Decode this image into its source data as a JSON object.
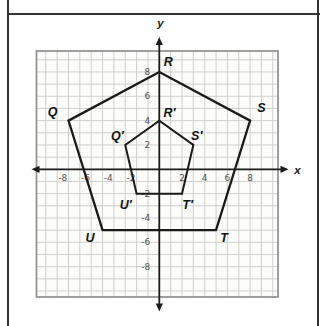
{
  "frame": {
    "line_color": "#333333"
  },
  "chart_data": {
    "type": "coordinate-plane-polygons",
    "axes": {
      "x_label": "x",
      "y_label": "y",
      "x_range": [
        -10,
        10
      ],
      "y_range": [
        -10,
        10
      ],
      "grid": true
    },
    "x_ticks": [
      {
        "v": -8,
        "label": "-8"
      },
      {
        "v": -6,
        "label": "-6"
      },
      {
        "v": -4,
        "label": "-4"
      },
      {
        "v": -2,
        "label": "-2"
      },
      {
        "v": 2,
        "label": "2"
      },
      {
        "v": 4,
        "label": "4"
      },
      {
        "v": 6,
        "label": "6"
      },
      {
        "v": 8,
        "label": "8"
      }
    ],
    "y_ticks": [
      {
        "v": 8,
        "label": "8"
      },
      {
        "v": 6,
        "label": "6"
      },
      {
        "v": 4,
        "label": "4"
      },
      {
        "v": 2,
        "label": "2"
      },
      {
        "v": -2,
        "label": "-2"
      },
      {
        "v": -4,
        "label": "-4"
      },
      {
        "v": -6,
        "label": "-6"
      },
      {
        "v": -8,
        "label": "-8"
      }
    ],
    "polygons": [
      {
        "id": "pentagon-QRSTU",
        "stroke_width": 2.3,
        "vertices": [
          {
            "label": "Q",
            "x": -8,
            "y": 4,
            "lx": -9.4,
            "ly": 4.7
          },
          {
            "label": "R",
            "x": 0,
            "y": 8,
            "lx": 0.8,
            "ly": 8.85
          },
          {
            "label": "S",
            "x": 8,
            "y": 4,
            "lx": 9.0,
            "ly": 5.0
          },
          {
            "label": "T",
            "x": 5,
            "y": -5,
            "lx": 5.7,
            "ly": -5.65
          },
          {
            "label": "U",
            "x": -5,
            "y": -5,
            "lx": -6.1,
            "ly": -5.65
          }
        ]
      },
      {
        "id": "pentagon-QRSTU-prime",
        "stroke_width": 2.0,
        "vertices": [
          {
            "label": "Q′",
            "x": -3,
            "y": 2,
            "lx": -3.7,
            "ly": 2.75
          },
          {
            "label": "R′",
            "x": 0,
            "y": 4,
            "lx": 0.9,
            "ly": 4.65
          },
          {
            "label": "S′",
            "x": 3,
            "y": 2,
            "lx": 3.3,
            "ly": 2.7
          },
          {
            "label": "T′",
            "x": 2,
            "y": -2,
            "lx": 2.5,
            "ly": -2.95
          },
          {
            "label": "U′",
            "x": -2,
            "y": -2,
            "lx": -2.95,
            "ly": -2.95
          }
        ]
      }
    ]
  },
  "layout": {
    "origin_px": {
      "x": 159.3,
      "y": 169.3
    },
    "unit_px": {
      "x": 11.35,
      "y": 12.17
    },
    "grid_border_px": {
      "left": 36.5,
      "top": 51,
      "right": 278,
      "bottom": 297
    },
    "axis_ends_px": {
      "x_start": 31.5,
      "x_end": 288.5,
      "y_start": 37,
      "y_end": 311.5
    },
    "axis_label_px": {
      "x": [
        297.5,
        169.5
      ],
      "y": [
        160.5,
        22.5
      ]
    },
    "colors": {
      "paper": "#fdfdfb",
      "grid_line": "#c9c9c9",
      "grid_border": "#8f8f8f",
      "axis": "#1c1c1c",
      "tick_text": "#525252",
      "shape": "#1a1a1a",
      "label_text": "#141414"
    }
  }
}
